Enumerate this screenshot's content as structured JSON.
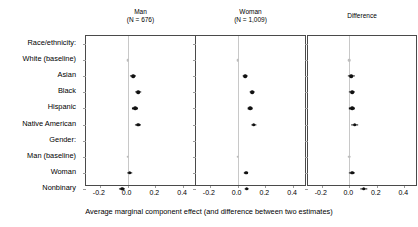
{
  "chart_data": {
    "type": "scatter",
    "title": "",
    "xlabel": "Average marginal component effect (and difference between two estimates)",
    "ylabel": "",
    "xlim": [
      -0.3,
      0.5
    ],
    "xticks": [
      -0.2,
      0.0,
      0.2,
      0.4
    ],
    "xticklabels": [
      "-0.2",
      "0.0",
      "0.2",
      "0.4"
    ],
    "grid": false,
    "legend": "none",
    "zero_reference_line": 0.0,
    "panels": [
      {
        "label": "Man",
        "n_label": "(N = 676)",
        "n": 676,
        "values": [
          null,
          0.0,
          0.04,
          0.075,
          0.055,
          0.075,
          null,
          0.0,
          0.015,
          -0.04
        ],
        "ci_low": [
          null,
          0.0,
          0.018,
          0.055,
          0.033,
          0.053,
          null,
          0.0,
          -0.005,
          -0.062
        ],
        "ci_high": [
          null,
          0.0,
          0.062,
          0.095,
          0.077,
          0.097,
          null,
          0.0,
          0.035,
          -0.018
        ]
      },
      {
        "label": "Woman",
        "n_label": "(N = 1,009)",
        "n": 1009,
        "values": [
          null,
          0.0,
          0.055,
          0.105,
          0.09,
          0.115,
          null,
          0.0,
          0.06,
          0.065
        ],
        "ci_low": [
          null,
          0.0,
          0.038,
          0.088,
          0.073,
          0.096,
          null,
          0.0,
          0.044,
          0.048
        ],
        "ci_high": [
          null,
          0.0,
          0.072,
          0.122,
          0.107,
          0.134,
          null,
          0.0,
          0.076,
          0.082
        ]
      },
      {
        "label": "Difference",
        "n_label": "",
        "n": null,
        "values": [
          null,
          0.0,
          0.015,
          0.02,
          0.02,
          0.04,
          null,
          0.0,
          0.02,
          0.105
        ],
        "ci_low": [
          null,
          0.0,
          -0.008,
          -0.003,
          -0.003,
          0.012,
          null,
          0.0,
          -0.003,
          0.078
        ],
        "ci_high": [
          null,
          0.0,
          0.038,
          0.043,
          0.043,
          0.068,
          null,
          0.0,
          0.043,
          0.132
        ]
      }
    ],
    "categories": [
      {
        "label": "Race/ethnicity:",
        "kind": "group"
      },
      {
        "label": "White (baseline)",
        "kind": "baseline"
      },
      {
        "label": "Asian",
        "kind": "level"
      },
      {
        "label": "Black",
        "kind": "level"
      },
      {
        "label": "Hispanic",
        "kind": "level"
      },
      {
        "label": "Native American",
        "kind": "level"
      },
      {
        "label": "Gender:",
        "kind": "group"
      },
      {
        "label": "Man (baseline)",
        "kind": "baseline"
      },
      {
        "label": "Woman",
        "kind": "level"
      },
      {
        "label": "Nonbinary",
        "kind": "level"
      }
    ]
  },
  "colors": {
    "point": "#111111",
    "baseline_point": "#bdbdbd",
    "zero_line": "#c8c8c8",
    "panel_border": "#4a4a4a",
    "background": "#ffffff",
    "text": "#000000"
  }
}
